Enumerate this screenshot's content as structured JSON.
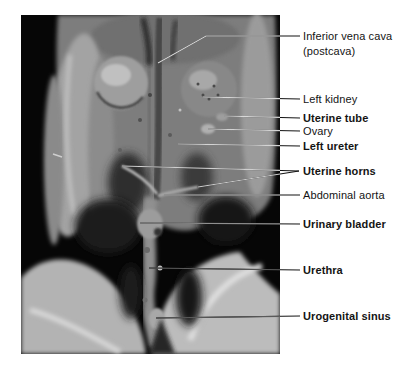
{
  "figure": {
    "photo_description": "ventral dissection photograph of a female cat abdomen and pelvis showing the urogenital system on a black background",
    "colors": {
      "page_bg": "#ffffff",
      "photo_bg": "#060606",
      "label_text": "#141414",
      "leader_outside": "#141414"
    },
    "labels": [
      {
        "id": "inferior-vena-cava",
        "line1": "Inferior vena cava",
        "line2": "(postcava)",
        "bold": false,
        "x": 303,
        "top": 29,
        "leaders": [
          [
            [
              300,
              36
            ],
            [
              206,
              36
            ],
            [
              158,
              63
            ]
          ]
        ],
        "leader_photo_color": "#d8d8d8"
      },
      {
        "id": "left-kidney",
        "line1": "Left kidney",
        "bold": false,
        "x": 303,
        "top": 92,
        "leaders": [
          [
            [
              300,
              99
            ],
            [
              203,
              97
            ]
          ]
        ],
        "leader_photo_color": "#d8d8d8"
      },
      {
        "id": "uterine-tube",
        "line1": "Uterine tube",
        "bold": true,
        "x": 303,
        "top": 111,
        "leaders": [
          [
            [
              300,
              118
            ],
            [
              224,
              116
            ]
          ]
        ],
        "leader_photo_color": "#d8d8d8"
      },
      {
        "id": "ovary",
        "line1": "Ovary",
        "bold": false,
        "x": 303,
        "top": 124,
        "leaders": [
          [
            [
              300,
              131
            ],
            [
              208,
              129
            ]
          ]
        ],
        "leader_photo_color": "#d4d4d4"
      },
      {
        "id": "left-ureter",
        "line1": "Left ureter",
        "bold": true,
        "x": 303,
        "top": 139,
        "leaders": [
          [
            [
              300,
              146
            ],
            [
              178,
              144
            ]
          ]
        ],
        "leader_photo_color": "#d4d4d4"
      },
      {
        "id": "uterine-horns",
        "line1": "Uterine horns",
        "bold": true,
        "x": 303,
        "top": 164,
        "leaders": [
          [
            [
              299,
              171
            ],
            [
              122,
              166
            ]
          ],
          [
            [
              299,
              171
            ],
            [
              198,
              187
            ]
          ]
        ],
        "leader_photo_color": "#cfcfcf"
      },
      {
        "id": "abdominal-aorta",
        "line1": "Abdominal aorta",
        "bold": false,
        "x": 303,
        "top": 188,
        "leaders": [
          [
            [
              300,
              195
            ],
            [
              164,
              195
            ]
          ]
        ],
        "leader_photo_color": "#c9c9c9"
      },
      {
        "id": "urinary-bladder",
        "line1": "Urinary bladder",
        "bold": true,
        "x": 303,
        "top": 217,
        "leaders": [
          [
            [
              300,
              224
            ],
            [
              140,
              223
            ]
          ]
        ],
        "leader_photo_color": "#8f8f8f"
      },
      {
        "id": "urethra",
        "line1": "Urethra",
        "bold": true,
        "x": 303,
        "top": 263,
        "leaders": [
          [
            [
              300,
              270
            ],
            [
              149,
              268
            ]
          ]
        ],
        "leader_photo_color": "#5a5a5a"
      },
      {
        "id": "urogenital-sinus",
        "line1": "Urogenital sinus",
        "bold": true,
        "x": 303,
        "top": 309,
        "leaders": [
          [
            [
              300,
              316
            ],
            [
              156,
              318
            ]
          ]
        ],
        "leader_photo_color": "#5a5a5a"
      }
    ]
  }
}
